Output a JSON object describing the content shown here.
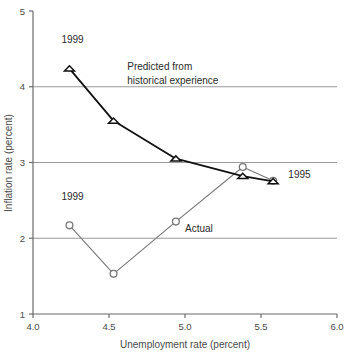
{
  "chart_data": {
    "type": "line",
    "title": "",
    "xlabel": "Unemployment rate (percent)",
    "ylabel": "Inflation rate (percent)",
    "xlim": [
      4.0,
      6.0
    ],
    "ylim": [
      1,
      5
    ],
    "xticks": [
      "4.0",
      "4.5",
      "5.0",
      "5.5",
      "6.0"
    ],
    "xtick_values": [
      4.0,
      4.5,
      5.0,
      5.5,
      6.0
    ],
    "yticks": [
      "1",
      "2",
      "3",
      "4",
      "5"
    ],
    "ytick_values": [
      1,
      2,
      3,
      4,
      5
    ],
    "grid": "horizontal gridlines at 2, 3, 4",
    "gridline_values": [
      2,
      3,
      4
    ],
    "legend_position": "inline annotations",
    "series": [
      {
        "name": "Predicted from historical experience",
        "marker": "triangle",
        "color": "#111111",
        "points": [
          {
            "x": 4.24,
            "y": 4.24,
            "label": "1999"
          },
          {
            "x": 4.53,
            "y": 3.55,
            "label": ""
          },
          {
            "x": 4.94,
            "y": 3.05,
            "label": ""
          },
          {
            "x": 5.38,
            "y": 2.82,
            "label": ""
          },
          {
            "x": 5.58,
            "y": 2.75,
            "label": "1995"
          }
        ]
      },
      {
        "name": "Actual",
        "marker": "circle",
        "color": "#777777",
        "points": [
          {
            "x": 4.24,
            "y": 2.17,
            "label": "1999"
          },
          {
            "x": 4.53,
            "y": 1.53,
            "label": ""
          },
          {
            "x": 4.94,
            "y": 2.22,
            "label": ""
          },
          {
            "x": 5.38,
            "y": 2.94,
            "label": ""
          },
          {
            "x": 5.58,
            "y": 2.76,
            "label": "1995"
          }
        ]
      }
    ],
    "annotations": [
      {
        "text": "1999",
        "x": 4.26,
        "y": 4.58,
        "anchor": "middle",
        "name": "predicted-1999-label"
      },
      {
        "text": "Predicted from",
        "x": 4.62,
        "y": 4.22,
        "anchor": "start",
        "name": "predicted-series-label-line1"
      },
      {
        "text": "historical experience",
        "x": 4.62,
        "y": 4.03,
        "anchor": "start",
        "name": "predicted-series-label-line2"
      },
      {
        "text": "1995",
        "x": 5.68,
        "y": 2.8,
        "anchor": "start",
        "name": "year-1995-label"
      },
      {
        "text": "1999",
        "x": 4.26,
        "y": 2.5,
        "anchor": "middle",
        "name": "actual-1999-label"
      },
      {
        "text": "Actual",
        "x": 5.0,
        "y": 2.08,
        "anchor": "start",
        "name": "actual-series-label"
      }
    ]
  },
  "colors": {
    "predicted_series": "#111111",
    "actual_series": "#777777",
    "gridline": "#9a9a9a",
    "axis": "#6b6b6b",
    "text": "#3a3a3a",
    "background": "#ffffff"
  },
  "axes": {
    "x_title": "Unemployment rate (percent)",
    "y_title": "Inflation rate (percent)",
    "x_tick_0": "4.0",
    "x_tick_1": "4.5",
    "x_tick_2": "5.0",
    "x_tick_3": "5.5",
    "x_tick_4": "6.0",
    "y_tick_0": "1",
    "y_tick_1": "2",
    "y_tick_2": "3",
    "y_tick_3": "4",
    "y_tick_4": "5"
  }
}
